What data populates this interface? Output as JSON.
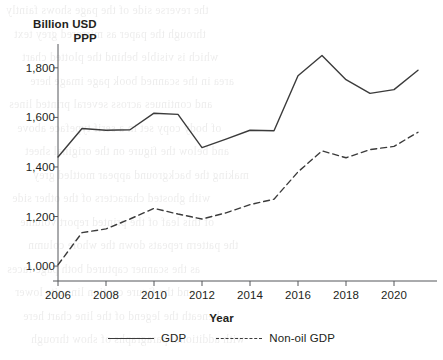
{
  "chart_data": {
    "type": "line",
    "title": "",
    "xlabel": "Year",
    "ylabel": "Billion USD PPP",
    "ylabel_line1": "Billion USD",
    "ylabel_line2": "PPP",
    "x": [
      2006,
      2007,
      2008,
      2009,
      2010,
      2011,
      2012,
      2013,
      2014,
      2015,
      2016,
      2017,
      2018,
      2019,
      2020,
      2021
    ],
    "xlim": [
      2006,
      2021
    ],
    "ylim": [
      960,
      1880
    ],
    "xticks": [
      2006,
      2008,
      2010,
      2012,
      2014,
      2016,
      2018,
      2020
    ],
    "xtick_labels": [
      "2006",
      "2008",
      "2010",
      "2012",
      "2014",
      "2016",
      "2018",
      "2020"
    ],
    "yticks": [
      1000,
      1200,
      1400,
      1600,
      1800
    ],
    "ytick_labels": [
      "1,000",
      "1,200",
      "1,400",
      "1,600",
      "1,800"
    ],
    "grid": false,
    "legend_position": "bottom",
    "series": [
      {
        "name": "GDP",
        "style": "solid",
        "color": "#3b3b3b",
        "values": [
          1440,
          1555,
          1548,
          1550,
          1617,
          1612,
          1478,
          1512,
          1548,
          1546,
          1768,
          1850,
          1752,
          1697,
          1712,
          1790
        ]
      },
      {
        "name": "Non-oil GDP",
        "style": "dashed",
        "color": "#3b3b3b",
        "values": [
          1005,
          1135,
          1150,
          1190,
          1233,
          1210,
          1190,
          1215,
          1248,
          1270,
          1380,
          1465,
          1437,
          1470,
          1483,
          1540
        ]
      }
    ]
  },
  "legend": {
    "items": [
      {
        "label": "GDP",
        "style": "solid"
      },
      {
        "label": "Non-oil GDP",
        "style": "dashed"
      }
    ]
  },
  "bleed_text": {
    "lines": [
      "the reverse side of the page shows faintly",
      "through the paper as mirrored grey text",
      "which is visible behind the plotted chart",
      "area in the scanned book page image here",
      "and continues across several printed lines",
      "of body copy set in a serif typeface above",
      "and below the figure on the original sheet",
      "making the background appear mottled grey",
      "with ghosted characters of the other side",
      "of this leaf of the printed report volume",
      "the pattern repeats down the whole column",
      "as the scanner captured both page faces",
      "and the figure caption line sits lower",
      "beneath the legend of the line chart here",
      "with additional paragraphs of show through"
    ]
  }
}
